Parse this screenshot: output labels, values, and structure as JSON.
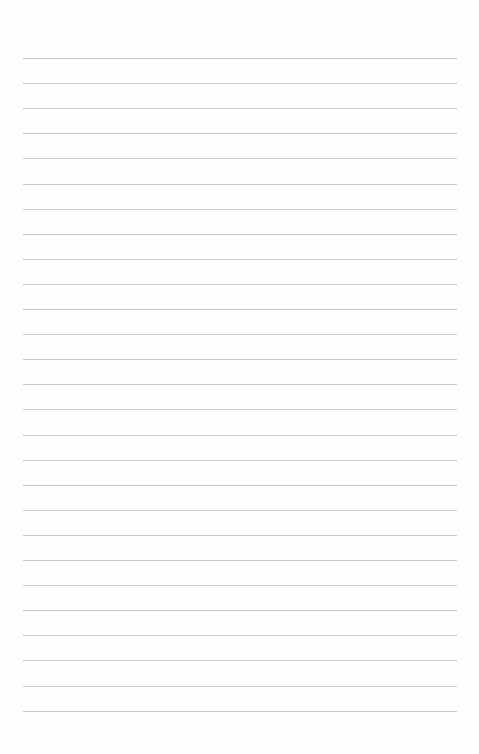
{
  "page": {
    "type": "lined-paper",
    "background_color": "#fefefe",
    "rule_color": "#c9c9c9",
    "rule_count": 27,
    "first_rule_y": 58,
    "rule_spacing": 25.1,
    "rule_left": 23,
    "rule_width": 434
  }
}
